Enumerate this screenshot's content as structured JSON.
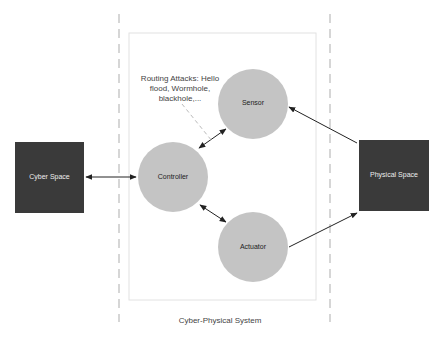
{
  "diagram": {
    "title": "Cyber-Physical System",
    "nodes": {
      "cyber_space": {
        "label": "Cyber Space",
        "shape": "square",
        "color": "#3a3a3a"
      },
      "physical_space": {
        "label": "Physical Space",
        "shape": "square",
        "color": "#3a3a3a"
      },
      "sensor": {
        "label": "Sensor",
        "shape": "circle",
        "color": "#c4c4c4"
      },
      "controller": {
        "label": "Controller",
        "shape": "circle",
        "color": "#c4c4c4"
      },
      "actuator": {
        "label": "Actuator",
        "shape": "circle",
        "color": "#c4c4c4"
      }
    },
    "annotation": {
      "text": "Routing Attacks: Hello flood, Wormhole, blackhole,..."
    },
    "edges": [
      {
        "from": "cyber_space",
        "to": "controller",
        "type": "bidirectional"
      },
      {
        "from": "controller",
        "to": "sensor",
        "type": "bidirectional"
      },
      {
        "from": "controller",
        "to": "actuator",
        "type": "bidirectional"
      },
      {
        "from": "physical_space",
        "to": "sensor",
        "type": "directed"
      },
      {
        "from": "actuator",
        "to": "physical_space",
        "type": "directed"
      },
      {
        "from": "annotation",
        "to": "controller-sensor-link",
        "type": "dashed"
      }
    ]
  }
}
